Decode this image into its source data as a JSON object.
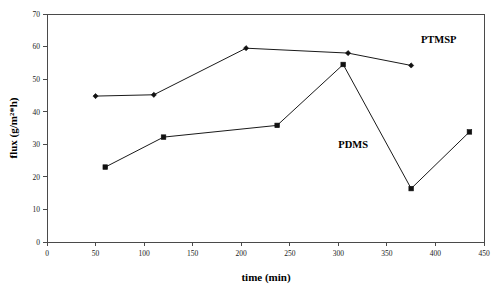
{
  "chart_data": {
    "type": "line",
    "title": "",
    "xlabel": "time (min)",
    "ylabel": "flux (g/m2*h)",
    "ylabel_display": "flux (g/m²*h)",
    "xlim": [
      0,
      450
    ],
    "ylim": [
      0,
      70
    ],
    "xticks": [
      0,
      50,
      100,
      150,
      200,
      250,
      300,
      350,
      400,
      450
    ],
    "yticks": [
      0,
      10,
      20,
      30,
      40,
      50,
      60,
      70
    ],
    "xtick_labels": [
      "0",
      "50",
      "100",
      "150",
      "200",
      "250",
      "300",
      "350",
      "400",
      "450"
    ],
    "ytick_labels": [
      "0",
      "10",
      "20",
      "30",
      "40",
      "50",
      "60",
      "70"
    ],
    "grid": false,
    "legend_position": "inline-annotation",
    "series": [
      {
        "name": "PTMSP",
        "marker": "diamond",
        "label_x": 385,
        "label_y": 61,
        "x": [
          50,
          110,
          205,
          310,
          375
        ],
        "y": [
          44.8,
          45.2,
          59.5,
          58.0,
          54.2
        ]
      },
      {
        "name": "PDMS",
        "marker": "square",
        "label_x": 300,
        "label_y": 29,
        "x": [
          60,
          120,
          237,
          305,
          375,
          435
        ],
        "y": [
          23.0,
          32.2,
          35.8,
          54.5,
          16.4,
          33.8
        ]
      }
    ],
    "annotations": [
      {
        "text": "PTMSP",
        "series": "PTMSP"
      },
      {
        "text": "PDMS",
        "series": "PDMS"
      }
    ]
  },
  "colors": {
    "line": "#1a1a1a",
    "axis": "#4a4a4a",
    "text": "#000000",
    "background": "#ffffff"
  }
}
